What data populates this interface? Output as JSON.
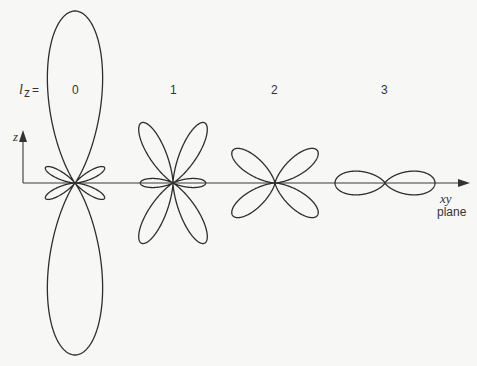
{
  "figure": {
    "row_label_main": "l",
    "row_label_sub": "z",
    "row_label_eq": "=",
    "z_axis_label": "z",
    "x_axis_label_1": "xy",
    "x_axis_label_2": "plane",
    "orbitals": [
      {
        "lz": "0",
        "description": "large vertical lobes along z with four small side lobes"
      },
      {
        "lz": "1",
        "description": "four diagonal lobes with two small horizontal lobes"
      },
      {
        "lz": "2",
        "description": "four diagonal lobes"
      },
      {
        "lz": "3",
        "description": "two horizontal lobes in the xy plane"
      }
    ]
  }
}
